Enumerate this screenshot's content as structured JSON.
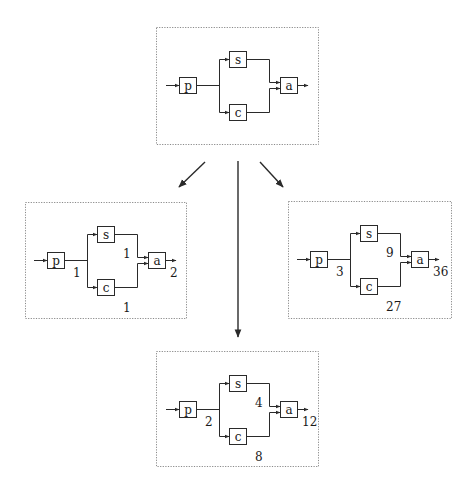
{
  "title": "",
  "node_names": {
    "p": "p",
    "s": "s",
    "c": "c",
    "a": "a"
  },
  "diagrams": [
    {
      "id": "template",
      "role": "source",
      "values": null
    },
    {
      "id": "instance-left",
      "role": "instance",
      "values": {
        "p_out": "1",
        "s_out": "1",
        "c_out": "1",
        "a_out": "2"
      }
    },
    {
      "id": "instance-right",
      "role": "instance",
      "values": {
        "p_out": "3",
        "s_out": "9",
        "c_out": "27",
        "a_out": "36"
      }
    },
    {
      "id": "instance-bottom",
      "role": "instance",
      "values": {
        "p_out": "2",
        "s_out": "4",
        "c_out": "8",
        "a_out": "12"
      }
    }
  ],
  "transitions": [
    {
      "from": "template",
      "to": "instance-left"
    },
    {
      "from": "template",
      "to": "instance-bottom"
    },
    {
      "from": "template",
      "to": "instance-right"
    }
  ],
  "colors": {
    "stroke": "#2a2a2a",
    "frame": "#8a8a8a",
    "background": "#ffffff"
  }
}
